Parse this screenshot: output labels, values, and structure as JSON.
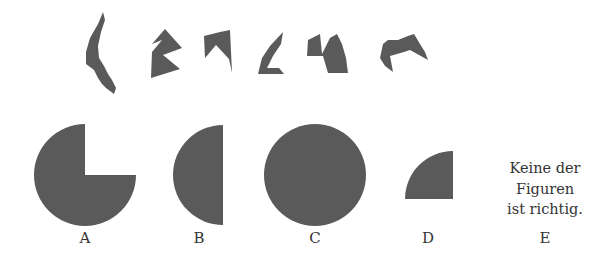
{
  "task": {
    "type": "figure-assembly puzzle",
    "fill_color": "#5a5a5a",
    "background_color": "#ffffff",
    "text_color": "#333333"
  },
  "pieces": [
    {
      "id": 1,
      "name": "piece-1",
      "points": "103,12 98,24 90,38 86,52 86,64 94,70 98,78 102,84 106,88 114,94 116,88 112,80 108,74 104,66 99,58 98,46 101,32 105,20"
    },
    {
      "id": 2,
      "name": "piece-2",
      "points": "165,29 152,44 162,40 152,52 151,78 180,69 163,55 182,48"
    },
    {
      "id": 3,
      "name": "piece-3",
      "points": "204,36 205,58 216,45 229,59 232,73 230,30 220,32"
    },
    {
      "id": 4,
      "name": "piece-4",
      "points": "283,32 270,46 262,58 258,74 284,74 279,68 267,68 273,56 281,44"
    },
    {
      "id": 5,
      "name": "piece-5",
      "points": "308,40 307,56 323,56 328,73 348,73 346,58 342,44 337,34 330,38 322,54 320,34"
    },
    {
      "id": 6,
      "name": "piece-6",
      "points": "383,44 380,58 385,66 393,72 390,56 404,52 410,50 428,60 425,52 420,44 414,34 408,36 398,40 388,40"
    }
  ],
  "answers": [
    {
      "letter": "A",
      "label_x": 85,
      "shape": "three-quarter-circle",
      "cx": 85,
      "cy": 175,
      "r": 51
    },
    {
      "letter": "B",
      "label_x": 199,
      "shape": "left-half-circle",
      "cx": 223,
      "cy": 175,
      "r": 50
    },
    {
      "letter": "C",
      "label_x": 315,
      "shape": "full-circle",
      "cx": 315,
      "cy": 175,
      "r": 51
    },
    {
      "letter": "D",
      "label_x": 428,
      "shape": "quarter-circle",
      "cx": 453,
      "cy": 199,
      "r": 48
    },
    {
      "letter": "E",
      "label_x": 545,
      "shape": "text"
    }
  ],
  "answer_e": {
    "lines": [
      "Keine der",
      "Figuren",
      "ist richtig."
    ]
  },
  "label_y": 230
}
